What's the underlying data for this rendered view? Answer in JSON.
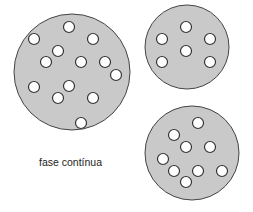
{
  "diagram": {
    "label": "fase contínua",
    "colors": {
      "continuous_phase": "#c9c9c9",
      "outline": "#444444",
      "droplet": "#ffffff",
      "background": "#ffffff"
    },
    "droplet_radius": 5.5,
    "particles": [
      {
        "name": "large-particle",
        "cx": 72,
        "cy": 72,
        "r": 58,
        "droplets": [
          [
            69,
            27
          ],
          [
            34,
            39
          ],
          [
            93,
            39
          ],
          [
            58,
            51
          ],
          [
            46,
            62
          ],
          [
            81,
            62
          ],
          [
            105,
            62
          ],
          [
            116,
            75
          ],
          [
            34,
            87
          ],
          [
            69,
            86
          ],
          [
            58,
            98
          ],
          [
            93,
            98
          ],
          [
            81,
            123
          ]
        ]
      },
      {
        "name": "top-right-particle",
        "cx": 187,
        "cy": 47,
        "r": 42,
        "droplets": [
          [
            186,
            27
          ],
          [
            162,
            39
          ],
          [
            210,
            39
          ],
          [
            186,
            51
          ],
          [
            162,
            62
          ],
          [
            210,
            62
          ]
        ]
      },
      {
        "name": "bottom-right-particle",
        "cx": 192,
        "cy": 153,
        "r": 47,
        "droplets": [
          [
            198,
            123
          ],
          [
            174,
            135
          ],
          [
            186,
            147
          ],
          [
            210,
            147
          ],
          [
            163,
            159
          ],
          [
            174,
            171
          ],
          [
            198,
            171
          ],
          [
            222,
            171
          ],
          [
            186,
            182
          ]
        ]
      }
    ]
  }
}
